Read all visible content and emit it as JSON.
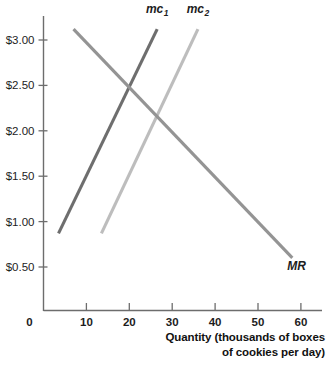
{
  "chart_data": {
    "type": "line",
    "title": "",
    "xlabel": "Quantity (thousands of boxes of cookies per day)",
    "ylabel": "",
    "xlim": [
      0,
      62
    ],
    "ylim": [
      0,
      3.35
    ],
    "grid": false,
    "legend": "inline-labels",
    "xticks": [
      0,
      10,
      20,
      30,
      40,
      50,
      60
    ],
    "xtick_labels": [
      "0",
      "10",
      "20",
      "30",
      "40",
      "50",
      "60"
    ],
    "yticks": [
      0.5,
      1.0,
      1.5,
      2.0,
      2.5,
      3.0
    ],
    "ytick_labels": [
      "$0.50",
      "$1.00",
      "$1.50",
      "$2.00",
      "$2.50",
      "$3.00"
    ],
    "series": [
      {
        "name": "mc1",
        "label": "mc",
        "subscript": "1",
        "color": "#6e6e6e",
        "x": [
          3.5,
          26.5
        ],
        "y": [
          0.87,
          3.12
        ],
        "label_x": 26.5,
        "label_y": 3.3
      },
      {
        "name": "mc2",
        "label": "mc",
        "subscript": "2",
        "color": "#bdbdbd",
        "x": [
          13.5,
          36.0
        ],
        "y": [
          0.87,
          3.12
        ],
        "label_x": 36.0,
        "label_y": 3.3
      },
      {
        "name": "MR",
        "label": "MR",
        "subscript": "",
        "color": "#949494",
        "x": [
          7.0,
          58.0
        ],
        "y": [
          3.12,
          0.6
        ],
        "label_x": 59.0,
        "label_y": 0.47
      }
    ],
    "axis_color": "#6d6d6d",
    "text_color": "#1d1d1d"
  },
  "xaxis_caption": {
    "line1": "Quantity (thousands of boxes",
    "line2": "of cookies per day)"
  }
}
